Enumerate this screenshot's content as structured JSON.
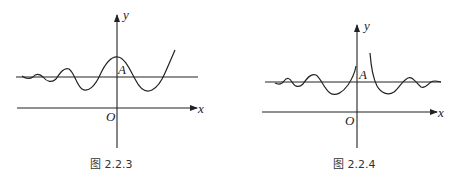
{
  "figures": [
    {
      "id": "fig-2-2-3",
      "caption": "图 2.2.3",
      "labels": {
        "y_axis": "y",
        "x_axis": "x",
        "origin": "O",
        "point": "A"
      },
      "description": "Oscillating curve about horizontal line through A, amplitude growing to the right, crossing y-axis above A"
    },
    {
      "id": "fig-2-2-4",
      "caption": "图 2.2.4",
      "labels": {
        "y_axis": "y",
        "x_axis": "x",
        "origin": "O",
        "point": "A"
      },
      "description": "Oscillating curve about horizontal line through A, amplitude decaying away from y-axis on both sides, with a discontinuity (vertical asymptote-like jump) just right of the y-axis"
    }
  ]
}
